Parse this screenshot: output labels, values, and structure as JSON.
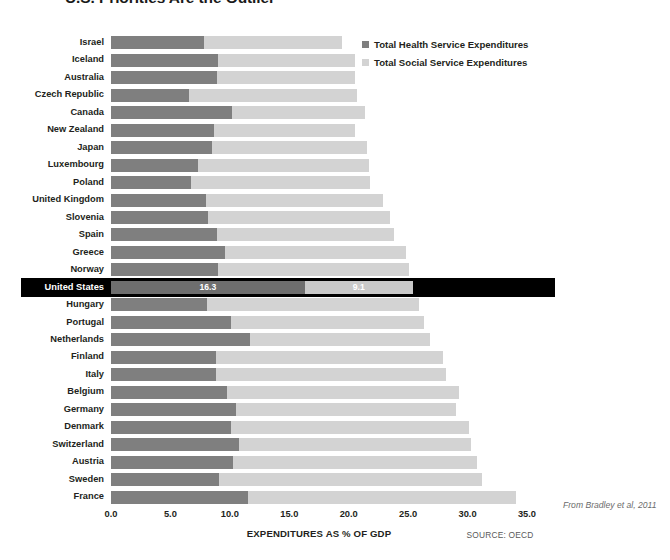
{
  "title": "U.S. Priorities Are the Outlier",
  "legend": {
    "position": "top-right",
    "items": [
      {
        "label": "Total Health Service Expenditures",
        "color": "#7f7f7f",
        "key": "health"
      },
      {
        "label": "Total Social Service Expenditures",
        "color": "#d3d3d3",
        "key": "social"
      }
    ]
  },
  "axis": {
    "xlabel": "EXPENDITURES AS % OF GDP",
    "ticks": [
      "0.0",
      "5.0",
      "10.0",
      "15.0",
      "20.0",
      "25.0",
      "30.0",
      "35.0"
    ],
    "min": 0,
    "max": 35
  },
  "source_note": "SOURCE: OECD",
  "attribution": "From Bradley et al, 2011",
  "highlight": {
    "country": "United States",
    "health_label": "16.3",
    "social_label": "9.1"
  },
  "chart_data": {
    "type": "bar",
    "orientation": "horizontal",
    "stacked": true,
    "title": "U.S. Priorities Are the Outlier",
    "xlabel": "EXPENDITURES AS % OF GDP",
    "ylabel": "",
    "xlim": [
      0,
      35
    ],
    "grid": false,
    "legend_position": "top-right",
    "categories": [
      "Israel",
      "Iceland",
      "Australia",
      "Czech Republic",
      "Canada",
      "New Zealand",
      "Japan",
      "Luxembourg",
      "Poland",
      "United Kingdom",
      "Slovenia",
      "Spain",
      "Greece",
      "Norway",
      "United States",
      "Hungary",
      "Portugal",
      "Netherlands",
      "Finland",
      "Italy",
      "Belgium",
      "Germany",
      "Denmark",
      "Switzerland",
      "Austria",
      "Sweden",
      "France"
    ],
    "series": [
      {
        "name": "Total Health Service Expenditures",
        "color": "#7f7f7f",
        "values": [
          7.8,
          9.0,
          8.9,
          6.6,
          10.2,
          8.7,
          8.5,
          7.3,
          6.7,
          8.0,
          8.2,
          8.9,
          9.6,
          9.0,
          16.3,
          8.1,
          10.1,
          11.7,
          8.8,
          8.8,
          9.8,
          10.5,
          10.1,
          10.8,
          10.3,
          9.1,
          11.5
        ]
      },
      {
        "name": "Total Social Service Expenditures",
        "color": "#d3d3d3",
        "values": [
          11.6,
          11.5,
          11.6,
          14.1,
          11.2,
          11.8,
          13.0,
          14.4,
          15.1,
          14.9,
          15.3,
          14.9,
          15.2,
          16.1,
          9.1,
          17.8,
          16.2,
          15.1,
          19.1,
          19.4,
          19.5,
          18.5,
          20.0,
          19.5,
          20.5,
          22.1,
          22.6
        ]
      }
    ],
    "totals": [
      19.4,
      20.5,
      20.5,
      20.7,
      21.4,
      20.5,
      21.5,
      21.7,
      21.8,
      22.9,
      23.5,
      23.8,
      24.8,
      25.1,
      25.4,
      25.9,
      26.3,
      26.8,
      27.9,
      28.2,
      29.3,
      29.0,
      30.1,
      30.3,
      30.8,
      31.2,
      34.1
    ],
    "data_labels": {
      "United States": {
        "health": "16.3",
        "social": "9.1"
      }
    }
  }
}
